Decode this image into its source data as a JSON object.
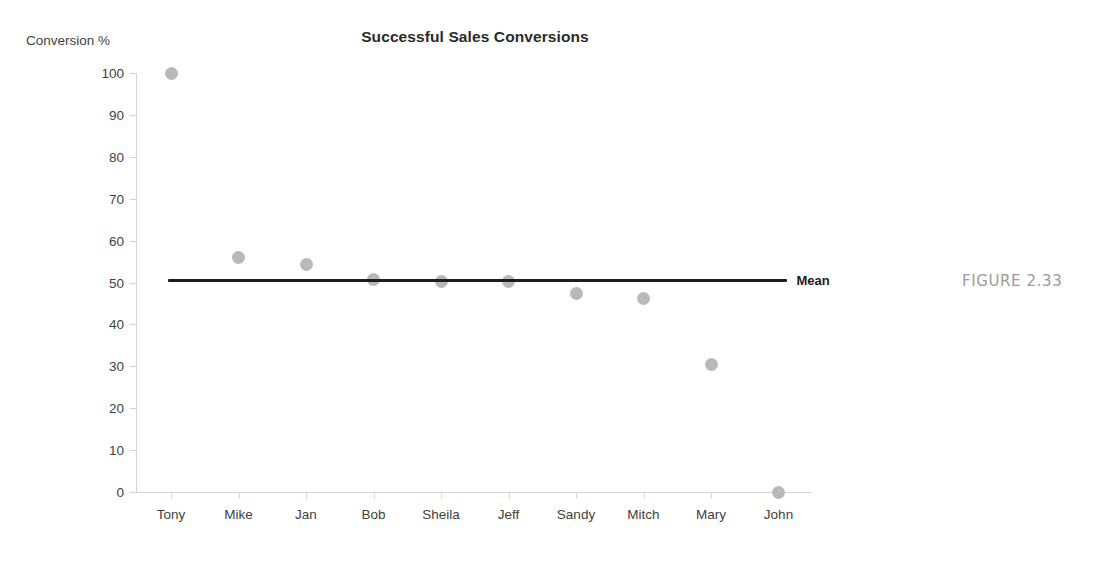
{
  "figure": {
    "caption": "FIGURE 2.33"
  },
  "chart_data": {
    "type": "scatter",
    "title": "Successful Sales Conversions",
    "xlabel": "",
    "ylabel": "Conversion %",
    "categories": [
      "Tony",
      "Mike",
      "Jan",
      "Bob",
      "Sheila",
      "Jeff",
      "Sandy",
      "Mitch",
      "Mary",
      "John"
    ],
    "values": [
      100,
      56,
      54.4,
      50.7,
      50.2,
      50.2,
      47.3,
      46.2,
      30.5,
      0
    ],
    "series": [
      {
        "name": "Conversion %",
        "values": [
          100,
          56,
          54.4,
          50.7,
          50.2,
          50.2,
          47.3,
          46.2,
          30.5,
          0
        ]
      }
    ],
    "ylim": [
      0,
      100
    ],
    "yticks": [
      0,
      10,
      20,
      30,
      40,
      50,
      60,
      70,
      80,
      90,
      100
    ],
    "ytick_labels": [
      "0",
      "10",
      "20",
      "30",
      "40",
      "50",
      "60",
      "70",
      "80",
      "90",
      "100"
    ],
    "grid": false,
    "legend": "none",
    "reference_line": {
      "label": "Mean",
      "value": 50.5,
      "color": "#1d1d1d"
    },
    "marker_color": "#b9b9b9",
    "axis_color": "#d4d4d4",
    "title_color": "#2b2b2b",
    "caption_color": "#9a9a9a"
  }
}
